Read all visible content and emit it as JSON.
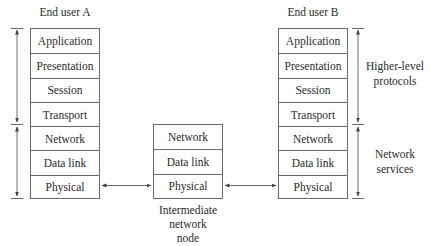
{
  "diagram": {
    "end_user_a": {
      "title": "End user A",
      "layers": [
        "Application",
        "Presentation",
        "Session",
        "Transport",
        "Network",
        "Data link",
        "Physical"
      ]
    },
    "end_user_b": {
      "title": "End user B",
      "layers": [
        "Application",
        "Presentation",
        "Session",
        "Transport",
        "Network",
        "Data link",
        "Physical"
      ]
    },
    "intermediate_node": {
      "title_lines": [
        "Intermediate",
        "network",
        "node"
      ],
      "layers": [
        "Network",
        "Data link",
        "Physical"
      ]
    },
    "groupings": {
      "higher_level": {
        "lines": [
          "Higher-level",
          "protocols"
        ]
      },
      "network_services": {
        "lines": [
          "Network",
          "services"
        ]
      }
    },
    "links": [
      {
        "from": "End user A / Physical",
        "to": "Intermediate network node / Physical"
      },
      {
        "from": "Intermediate network node / Physical",
        "to": "End user B / Physical"
      }
    ],
    "colors": {
      "line": "#6a6a6a",
      "text": "#2a2a2a",
      "background": "#ffffff"
    }
  }
}
